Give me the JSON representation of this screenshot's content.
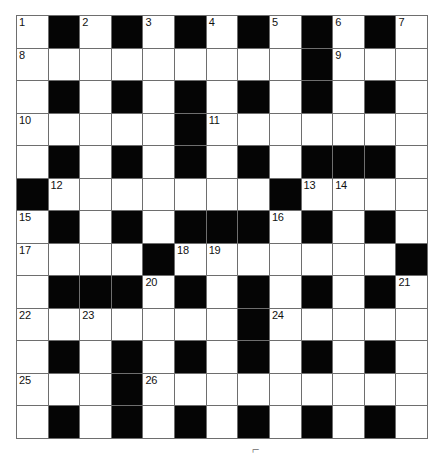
{
  "puzzle": {
    "type": "crossword-grid",
    "rows": 13,
    "cols": 13,
    "colors": {
      "block": "#050505",
      "open": "#ffffff",
      "rule": "#6e6e6e",
      "number": "#111111",
      "page_background": "#ffffff"
    },
    "legend": {
      "0": "open square",
      "1": "blocked square"
    },
    "grid": [
      [
        0,
        1,
        0,
        1,
        0,
        1,
        0,
        1,
        0,
        1,
        0,
        1,
        0
      ],
      [
        0,
        0,
        0,
        0,
        0,
        0,
        0,
        0,
        0,
        1,
        0,
        0,
        0
      ],
      [
        0,
        1,
        0,
        1,
        0,
        1,
        0,
        1,
        0,
        1,
        0,
        1,
        0
      ],
      [
        0,
        0,
        0,
        0,
        0,
        1,
        0,
        0,
        0,
        0,
        0,
        0,
        0
      ],
      [
        0,
        1,
        0,
        1,
        0,
        1,
        0,
        1,
        0,
        1,
        1,
        1,
        0
      ],
      [
        1,
        0,
        0,
        0,
        0,
        0,
        0,
        0,
        1,
        0,
        0,
        0,
        0
      ],
      [
        0,
        1,
        0,
        1,
        0,
        1,
        1,
        1,
        0,
        1,
        0,
        1,
        0
      ],
      [
        0,
        0,
        0,
        0,
        1,
        0,
        0,
        0,
        0,
        0,
        0,
        0,
        1
      ],
      [
        0,
        1,
        1,
        1,
        0,
        1,
        0,
        1,
        0,
        1,
        0,
        1,
        0
      ],
      [
        0,
        0,
        0,
        0,
        0,
        0,
        0,
        1,
        0,
        0,
        0,
        0,
        0
      ],
      [
        0,
        1,
        0,
        1,
        0,
        1,
        0,
        1,
        0,
        1,
        0,
        1,
        0
      ],
      [
        0,
        0,
        0,
        1,
        0,
        0,
        0,
        0,
        0,
        0,
        0,
        0,
        0
      ],
      [
        0,
        1,
        0,
        1,
        0,
        1,
        0,
        1,
        0,
        1,
        0,
        1,
        0
      ]
    ],
    "numbers": [
      {
        "row": 0,
        "col": 0,
        "label": "1"
      },
      {
        "row": 0,
        "col": 2,
        "label": "2"
      },
      {
        "row": 0,
        "col": 4,
        "label": "3"
      },
      {
        "row": 0,
        "col": 6,
        "label": "4"
      },
      {
        "row": 0,
        "col": 8,
        "label": "5"
      },
      {
        "row": 0,
        "col": 10,
        "label": "6"
      },
      {
        "row": 0,
        "col": 12,
        "label": "7"
      },
      {
        "row": 1,
        "col": 0,
        "label": "8"
      },
      {
        "row": 1,
        "col": 10,
        "label": "9"
      },
      {
        "row": 3,
        "col": 0,
        "label": "10"
      },
      {
        "row": 3,
        "col": 6,
        "label": "11"
      },
      {
        "row": 5,
        "col": 1,
        "label": "12"
      },
      {
        "row": 5,
        "col": 9,
        "label": "13"
      },
      {
        "row": 5,
        "col": 10,
        "label": "14"
      },
      {
        "row": 6,
        "col": 0,
        "label": "15"
      },
      {
        "row": 6,
        "col": 8,
        "label": "16"
      },
      {
        "row": 7,
        "col": 0,
        "label": "17"
      },
      {
        "row": 7,
        "col": 5,
        "label": "18"
      },
      {
        "row": 7,
        "col": 6,
        "label": "19"
      },
      {
        "row": 8,
        "col": 4,
        "label": "20"
      },
      {
        "row": 8,
        "col": 12,
        "label": "21"
      },
      {
        "row": 9,
        "col": 0,
        "label": "22"
      },
      {
        "row": 9,
        "col": 2,
        "label": "23"
      },
      {
        "row": 9,
        "col": 8,
        "label": "24"
      },
      {
        "row": 11,
        "col": 0,
        "label": "25"
      },
      {
        "row": 11,
        "col": 4,
        "label": "26"
      }
    ],
    "bottom_mark": "⌐"
  }
}
